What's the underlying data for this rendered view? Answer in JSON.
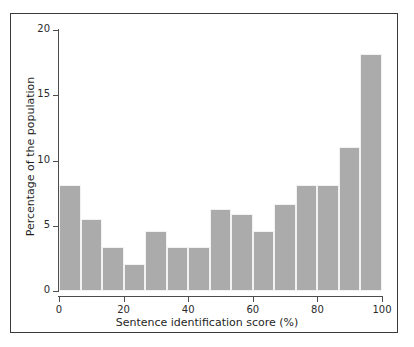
{
  "chart_data": {
    "type": "bar",
    "title": "",
    "subtitle": "",
    "xlabel": "Sentence identification score (%)",
    "ylabel": "Percentage of the population",
    "xlim": [
      0,
      100
    ],
    "ylim": [
      0,
      20
    ],
    "xticks": [
      0,
      20,
      40,
      60,
      80,
      100
    ],
    "yticks": [
      0,
      5,
      10,
      15,
      20
    ],
    "xtick_labels": [
      "0",
      "20",
      "40",
      "60",
      "80",
      "100"
    ],
    "ytick_labels": [
      "0",
      "5",
      "10",
      "15",
      "20"
    ],
    "grid": false,
    "legend": null,
    "bar_color": "#ababab",
    "bar_edge_color": "#f2f2f2",
    "axis_color": "#4d4d4d",
    "frame_color": "#3a3a3a",
    "background_color": "#ffffff",
    "bin_width": 6.667,
    "bin_edges": [
      0,
      6.67,
      13.33,
      20,
      26.67,
      33.33,
      40,
      46.67,
      53.33,
      60,
      66.67,
      73.33,
      80,
      86.67,
      93.33,
      100
    ],
    "bin_centers": [
      3.33,
      10,
      16.67,
      23.33,
      30,
      36.67,
      43.33,
      50,
      56.67,
      63.33,
      70,
      76.67,
      83.33,
      90,
      96.67
    ],
    "categories": [
      "0-6.7",
      "6.7-13.3",
      "13.3-20",
      "20-26.7",
      "26.7-33.3",
      "33.3-40",
      "40-46.7",
      "46.7-53.3",
      "53.3-60",
      "60-66.7",
      "66.7-73.3",
      "73.3-80",
      "80-86.7",
      "86.7-93.3",
      "93.3-100"
    ],
    "values": [
      8.1,
      5.5,
      3.4,
      2.1,
      4.6,
      3.4,
      3.4,
      6.3,
      5.9,
      4.6,
      6.7,
      8.1,
      8.1,
      11.0,
      18.2
    ]
  }
}
